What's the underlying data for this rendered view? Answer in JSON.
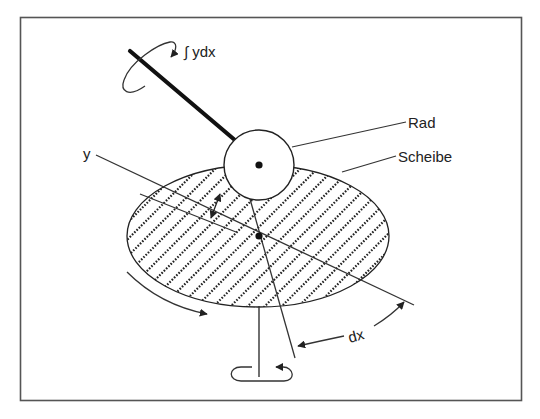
{
  "diagram": {
    "type": "mechanical-integrator",
    "colors": {
      "stroke": "#222222",
      "frame": "#555555",
      "background": "#ffffff"
    },
    "labels": {
      "integral": "∫ ydx",
      "wheel": "Rad",
      "disc": "Scheibe",
      "y": "y",
      "dx": "dx"
    },
    "components": [
      {
        "id": "shaft-wheel",
        "description": "thick axle of the wheel with rotation arrow"
      },
      {
        "id": "wheel",
        "label": "Rad"
      },
      {
        "id": "disc",
        "label": "Scheibe",
        "fill": "diagonal dotted hatch"
      },
      {
        "id": "disc-shaft",
        "description": "vertical disc axle with rotation loop"
      },
      {
        "id": "y-distance",
        "label": "y"
      },
      {
        "id": "dx-angle",
        "label": "dx"
      }
    ]
  }
}
